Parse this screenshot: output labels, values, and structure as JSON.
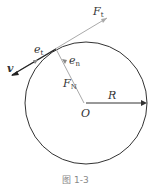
{
  "diagram": {
    "labels": {
      "Ft_main": "F",
      "Ft_sub": "t",
      "et_main": "e",
      "et_sub": "t",
      "en_main": "e",
      "en_sub": "n",
      "FN_main": "F",
      "FN_sub": "N",
      "v": "v",
      "O": "O",
      "R": "R"
    },
    "caption": "图 1-3"
  }
}
